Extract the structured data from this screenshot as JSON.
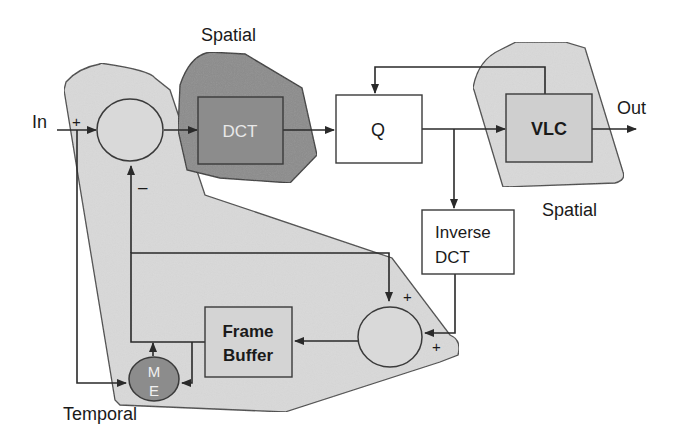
{
  "diagram": {
    "io": {
      "input_label": "In",
      "output_label": "Out"
    },
    "regions": [
      {
        "id": "temporal",
        "label": "Temporal",
        "fill": "#d9d9d9"
      },
      {
        "id": "spatial_dct",
        "label": "Spatial",
        "fill": "#8c8c8c"
      },
      {
        "id": "spatial_vlc",
        "label": "Spatial",
        "fill": "#d9d9d9"
      }
    ],
    "blocks": {
      "dct": {
        "label": "DCT",
        "fill": "#8c8c8c",
        "text_color": "#e8e8e8"
      },
      "q": {
        "label": "Q",
        "fill": "#ffffff"
      },
      "vlc": {
        "label": "VLC",
        "fill": "#cfcfcf"
      },
      "idct": {
        "line1": "Inverse",
        "line2": "DCT",
        "fill": "#ffffff"
      },
      "frame_buffer": {
        "line1": "Frame",
        "line2": "Buffer",
        "fill": "#d4d4d4"
      },
      "me": {
        "line1": "M",
        "line2": "E",
        "fill": "#8c8c8c",
        "text_color": "#f0f0f0"
      }
    },
    "summers": {
      "subtractor": {
        "signs": {
          "input": "+",
          "feedback": "–"
        }
      },
      "adder": {
        "signs": {
          "top": "+",
          "right": "+"
        }
      }
    }
  }
}
